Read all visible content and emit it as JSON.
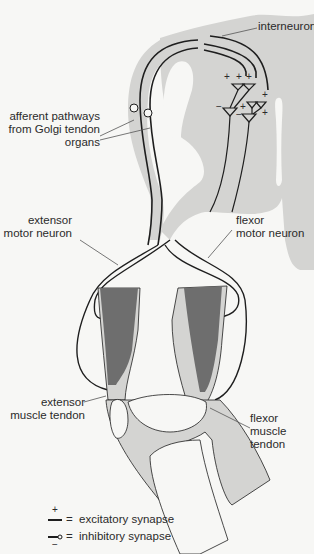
{
  "labels": {
    "interneurons": "interneurons",
    "afferent_1": "afferent pathways",
    "afferent_2": "from Golgi tendon",
    "afferent_3": "organs",
    "extensor_motor_1": "extensor",
    "extensor_motor_2": "motor neuron",
    "flexor_motor_1": "flexor",
    "flexor_motor_2": "motor neuron",
    "extensor_tendon_1": "extensor",
    "extensor_tendon_2": "muscle tendon",
    "flexor_tendon_1": "flexor",
    "flexor_tendon_2": "muscle",
    "flexor_tendon_3": "tendon"
  },
  "legend": {
    "excitatory_sign": "+",
    "excitatory_eq": "=",
    "excitatory_label": "excitatory synapse",
    "inhibitory_sign": "−",
    "inhibitory_eq": "=",
    "inhibitory_label": "inhibitory synapse"
  },
  "colors": {
    "background": "#f7f7f5",
    "tissue_light": "#d4d4d2",
    "muscle_dark": "#6e6e6e",
    "line": "#1e1e1e"
  }
}
